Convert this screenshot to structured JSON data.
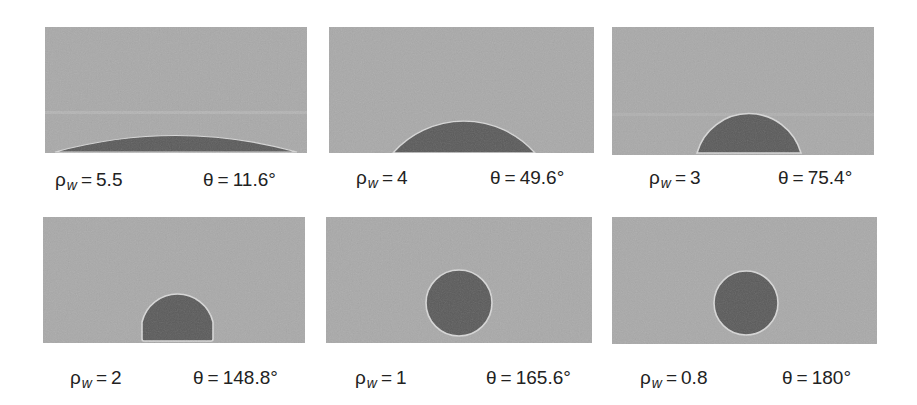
{
  "figure": {
    "colors": {
      "background": "#ffffff",
      "vapor": "#a9a9a9",
      "liquid": "#5a5a5a",
      "interface": "#d8d8d8",
      "text": "#222222"
    },
    "panels": [
      {
        "id": "a",
        "rho_symbol": "ρ",
        "rho_sub": "w",
        "equals": "=",
        "rho_value": "5.5",
        "theta_symbol": "θ",
        "theta_value": "11.6°",
        "rho_numeric": 5.5,
        "theta_deg": 11.6
      },
      {
        "id": "b",
        "rho_symbol": "ρ",
        "rho_sub": "w",
        "equals": "=",
        "rho_value": "4",
        "theta_symbol": "θ",
        "theta_value": "49.6°",
        "rho_numeric": 4,
        "theta_deg": 49.6
      },
      {
        "id": "c",
        "rho_symbol": "ρ",
        "rho_sub": "w",
        "equals": "=",
        "rho_value": "3",
        "theta_symbol": "θ",
        "theta_value": "75.4°",
        "rho_numeric": 3,
        "theta_deg": 75.4
      },
      {
        "id": "d",
        "rho_symbol": "ρ",
        "rho_sub": "w",
        "equals": "=",
        "rho_value": "2",
        "theta_symbol": "θ",
        "theta_value": "148.8°",
        "rho_numeric": 2,
        "theta_deg": 148.8
      },
      {
        "id": "e",
        "rho_symbol": "ρ",
        "rho_sub": "w",
        "equals": "=",
        "rho_value": "1",
        "theta_symbol": "θ",
        "theta_value": "165.6°",
        "rho_numeric": 1,
        "theta_deg": 165.6
      },
      {
        "id": "f",
        "rho_symbol": "ρ",
        "rho_sub": "w",
        "equals": "=",
        "rho_value": "0.8",
        "theta_symbol": "θ",
        "theta_value": "180°",
        "rho_numeric": 0.8,
        "theta_deg": 180
      }
    ]
  }
}
